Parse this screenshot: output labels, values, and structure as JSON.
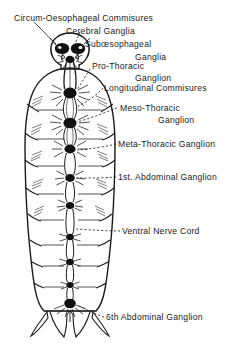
{
  "figure": {
    "background_color": "#ffffff",
    "ink_color": "#1a1a1a"
  },
  "labels": [
    {
      "id": "circum-oesophageal-commisures",
      "text": "Circum-Oesophageal Commisures",
      "x": 14,
      "y": 14
    },
    {
      "id": "cerebral-ganglia",
      "text": "Cerebral Ganglia",
      "x": 66,
      "y": 27
    },
    {
      "id": "suboesophageal",
      "text": "Subœsophageal",
      "x": 85,
      "y": 40
    },
    {
      "id": "ganglia",
      "text": "Ganglia",
      "x": 135,
      "y": 53
    },
    {
      "id": "pro-thoracic",
      "text": "Pro-Thoracic",
      "x": 92,
      "y": 62
    },
    {
      "id": "ganglion",
      "text": "Ganglion",
      "x": 135,
      "y": 74
    },
    {
      "id": "longitudinal-commisures",
      "text": "Longitudinal Commisures",
      "x": 104,
      "y": 84
    },
    {
      "id": "meso-thoracic",
      "text": "Meso-Thoracic",
      "x": 120,
      "y": 104
    },
    {
      "id": "meso-thoracic-ganglion",
      "text": "Ganglion",
      "x": 158,
      "y": 116
    },
    {
      "id": "meta-thoracic-ganglion",
      "text": "Meta-Thoracic Ganglion",
      "x": 118,
      "y": 140
    },
    {
      "id": "1st-abdominal-ganglion",
      "text": "1st. Abdominal Ganglion",
      "x": 118,
      "y": 173
    },
    {
      "id": "ventral-nerve-cord",
      "text": "Ventral Nerve Cord",
      "x": 122,
      "y": 227
    },
    {
      "id": "6th-abdominal-ganglion",
      "text": "6th Abdominal Ganglion",
      "x": 106,
      "y": 313
    }
  ],
  "anatomy": {
    "ganglia": [
      {
        "name": "cerebral-ganglion-left",
        "cx": 62,
        "cy": 49,
        "rx": 7.0,
        "ry": 5.5
      },
      {
        "name": "cerebral-ganglion-right",
        "cx": 78,
        "cy": 49,
        "rx": 7.0,
        "ry": 5.5
      },
      {
        "name": "suboesophageal-ganglion",
        "cx": 70,
        "cy": 60,
        "rx": 4.5,
        "ry": 3.6
      },
      {
        "name": "pro-thoracic-ganglion",
        "cx": 70,
        "cy": 93,
        "rx": 6.5,
        "ry": 5.5
      },
      {
        "name": "meso-thoracic-ganglion",
        "cx": 70,
        "cy": 123,
        "rx": 6.5,
        "ry": 5.5
      },
      {
        "name": "meta-thoracic-ganglion",
        "cx": 70,
        "cy": 149,
        "rx": 5.5,
        "ry": 4.6
      },
      {
        "name": "1st-abdominal-ganglion",
        "cx": 70,
        "cy": 178,
        "rx": 4.6,
        "ry": 4.0
      },
      {
        "name": "2nd-abdominal-ganglion",
        "cx": 70,
        "cy": 205,
        "rx": 4.0,
        "ry": 3.6
      },
      {
        "name": "3rd-abdominal-ganglion",
        "cx": 70,
        "cy": 237,
        "rx": 3.8,
        "ry": 3.4
      },
      {
        "name": "4th-abdominal-ganglion",
        "cx": 70,
        "cy": 262,
        "rx": 3.8,
        "ry": 3.4
      },
      {
        "name": "5th-abdominal-ganglion",
        "cx": 70,
        "cy": 285,
        "rx": 3.6,
        "ry": 3.2
      },
      {
        "name": "6th-abdominal-ganglion",
        "cx": 70,
        "cy": 303,
        "rx": 5.6,
        "ry": 4.8
      }
    ],
    "segment_lines_y": [
      80,
      105,
      133,
      160,
      188,
      214,
      240,
      262,
      283,
      300
    ],
    "body_outline_color": "#1a1a1a"
  }
}
